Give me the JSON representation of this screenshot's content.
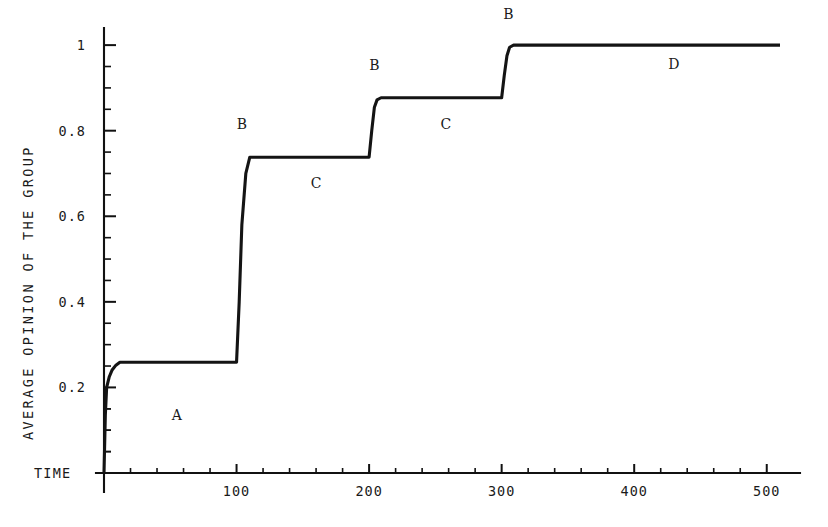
{
  "chart_data": {
    "type": "line",
    "title": "",
    "subtitle": "",
    "xlabel": "TIME",
    "ylabel": "AVERAGE OPINION OF THE GROUP",
    "xlim": [
      0,
      510
    ],
    "ylim": [
      0,
      1.04
    ],
    "grid": false,
    "legend": "none",
    "x_ticks_major": [
      100,
      200,
      300,
      400,
      500
    ],
    "x_tick_labels": [
      "100",
      "200",
      "300",
      "400",
      "500"
    ],
    "x_tick_minor_step": 20,
    "y_ticks_major": [
      0.2,
      0.4,
      0.6,
      0.8,
      1
    ],
    "y_tick_labels": [
      "0.2",
      "0.4",
      "0.6",
      "0.8",
      "1"
    ],
    "y_tick_minor_step": 0.05,
    "series": [
      {
        "name": "average opinion",
        "x": [
          0,
          1,
          2,
          4,
          6,
          9,
          12,
          100,
          102,
          104,
          107,
          110,
          200,
          202,
          204,
          206,
          209,
          300,
          302,
          304,
          306,
          309,
          510
        ],
        "values": [
          0.0,
          0.135,
          0.2,
          0.225,
          0.24,
          0.252,
          0.259,
          0.259,
          0.4,
          0.58,
          0.7,
          0.738,
          0.738,
          0.8,
          0.855,
          0.872,
          0.877,
          0.877,
          0.93,
          0.975,
          0.995,
          1.0,
          1.0
        ]
      }
    ],
    "annotations": [
      {
        "text": "A",
        "x": 55,
        "y": 0.125
      },
      {
        "text": "B",
        "x": 104,
        "y": 0.805
      },
      {
        "text": "C",
        "x": 160,
        "y": 0.665
      },
      {
        "text": "B",
        "x": 204,
        "y": 0.942
      },
      {
        "text": "C",
        "x": 258,
        "y": 0.805
      },
      {
        "text": "B",
        "x": 305,
        "y": 1.062
      },
      {
        "text": "D",
        "x": 430,
        "y": 0.945
      }
    ],
    "plateaus": [
      {
        "phase": "A",
        "level": 0.259,
        "from": 12,
        "to": 100
      },
      {
        "phase": "C",
        "level": 0.738,
        "from": 110,
        "to": 200
      },
      {
        "phase": "C",
        "level": 0.877,
        "from": 209,
        "to": 300
      },
      {
        "phase": "D",
        "level": 1.0,
        "from": 309,
        "to": 510
      }
    ],
    "jumps": [
      {
        "label": "B",
        "at": 100,
        "from": 0.259,
        "to": 0.738
      },
      {
        "label": "B",
        "at": 200,
        "from": 0.738,
        "to": 0.877
      },
      {
        "label": "B",
        "at": 300,
        "from": 0.877,
        "to": 1.0
      }
    ],
    "colors": {
      "line": "#141414",
      "axis": "#111111",
      "background": "#ffffff",
      "text": "#1a1a1a"
    }
  }
}
